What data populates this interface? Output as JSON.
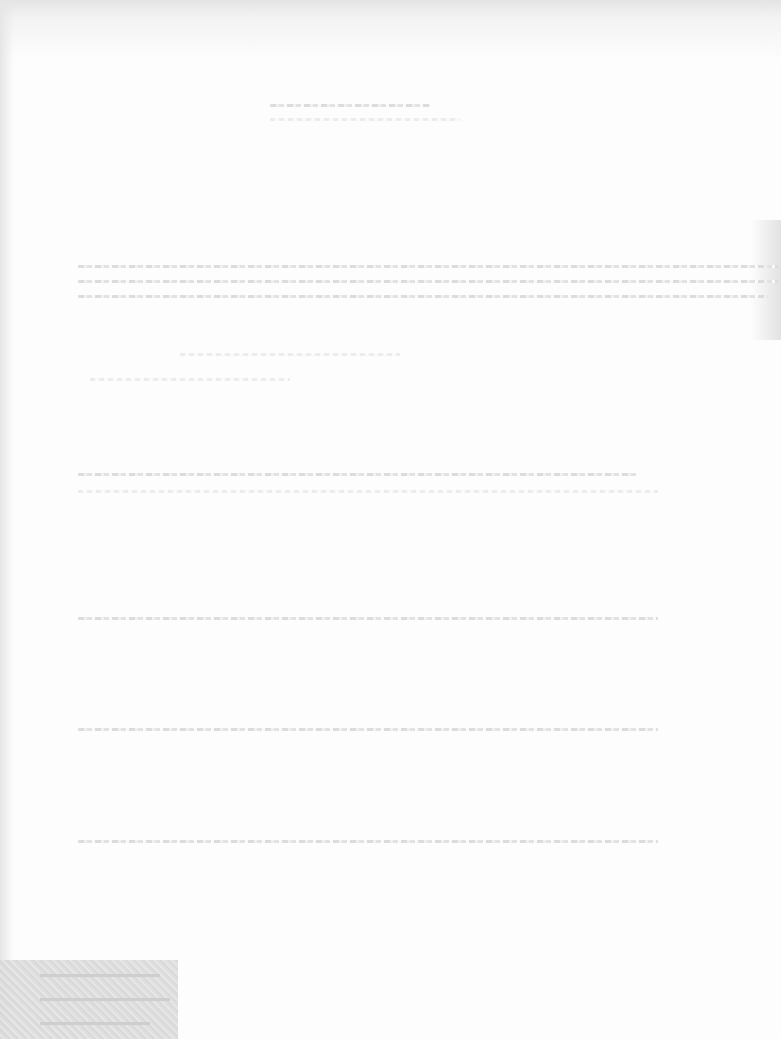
{
  "document": {
    "type": "faded scanned page",
    "legibility": "illegible",
    "title": {
      "text": ""
    },
    "paragraphs": [
      {
        "lines": [
          "",
          "",
          ""
        ]
      },
      {
        "lines": [
          "",
          ""
        ]
      },
      {
        "lines": [
          "",
          ""
        ]
      },
      {
        "lines": [
          ""
        ]
      },
      {
        "lines": [
          ""
        ]
      },
      {
        "lines": [
          ""
        ]
      }
    ],
    "stamp": {
      "text": ""
    }
  }
}
